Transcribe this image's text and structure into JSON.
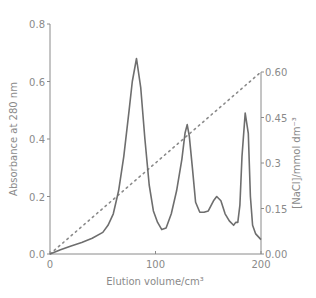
{
  "chart_data": {
    "type": "line",
    "title": "",
    "xlabel": "Elution volume/cm³",
    "ylabel": "Absorbance at 280 nm",
    "ylabel_right": "[NaCl]/mmol dm⁻³",
    "xlim": [
      0,
      200
    ],
    "ylim": [
      0,
      0.8
    ],
    "ylim_right": [
      0,
      0.6
    ],
    "x_ticks": [
      "0",
      "100",
      "200"
    ],
    "y_ticks": [
      "0.0",
      "0.2",
      "0.4",
      "0.6",
      "0.8"
    ],
    "y_ticks_right": [
      "0.00",
      "0.15",
      "0.3",
      "0.45",
      "0.60"
    ],
    "grid": false,
    "series": [
      {
        "name": "Absorbance at 280 nm",
        "axis": "left",
        "style": "solid",
        "x": [
          0,
          10,
          20,
          30,
          40,
          50,
          55,
          60,
          65,
          70,
          75,
          78,
          82,
          86,
          90,
          94,
          98,
          102,
          106,
          110,
          115,
          120,
          125,
          128,
          130,
          132,
          135,
          138,
          142,
          146,
          150,
          155,
          158,
          162,
          166,
          170,
          174,
          176,
          178,
          180,
          182,
          185,
          188,
          190,
          192,
          195,
          200
        ],
        "y": [
          0.0,
          0.015,
          0.028,
          0.04,
          0.055,
          0.075,
          0.1,
          0.14,
          0.22,
          0.34,
          0.5,
          0.6,
          0.68,
          0.58,
          0.4,
          0.24,
          0.15,
          0.11,
          0.085,
          0.09,
          0.14,
          0.22,
          0.33,
          0.42,
          0.45,
          0.41,
          0.3,
          0.18,
          0.145,
          0.145,
          0.15,
          0.185,
          0.2,
          0.185,
          0.14,
          0.115,
          0.1,
          0.11,
          0.11,
          0.17,
          0.34,
          0.49,
          0.42,
          0.2,
          0.1,
          0.07,
          0.05
        ]
      },
      {
        "name": "[NaCl]",
        "axis": "right",
        "style": "dotted",
        "x": [
          0,
          200
        ],
        "y": [
          0.0,
          0.6
        ]
      }
    ]
  }
}
